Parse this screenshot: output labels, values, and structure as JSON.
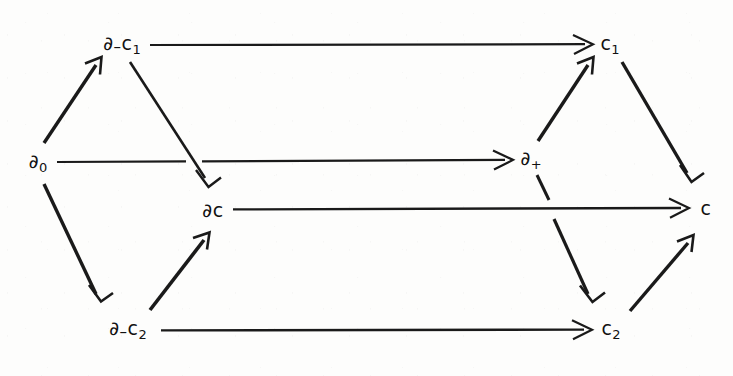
{
  "diagram": {
    "kind": "commutative-diagram",
    "background_color": "#fdfdfc",
    "ink_color": "#1a1a1a",
    "width": 733,
    "height": 376,
    "nodes": [
      {
        "id": "d0",
        "label_html": "∂<span class=\"sub\">0</span>",
        "label_text": "ℂ0",
        "x": 38,
        "y": 163
      },
      {
        "id": "dmc1",
        "label_html": "∂<span class=\"mid\">–</span>c<span class=\"sub\">1</span>",
        "label_text": "∂–c1",
        "x": 122,
        "y": 45
      },
      {
        "id": "dc",
        "label_html": "∂c",
        "label_text": "∂c",
        "x": 213,
        "y": 210
      },
      {
        "id": "dmc2",
        "label_html": "∂<span class=\"mid\">–</span>c<span class=\"sub\">2</span>",
        "label_text": "∂–c2",
        "x": 128,
        "y": 330
      },
      {
        "id": "dplus",
        "label_html": "∂<span class=\"sub\">+</span>",
        "label_text": "∂+",
        "x": 531,
        "y": 160
      },
      {
        "id": "c1",
        "label_html": "c<span class=\"sub\">1</span>",
        "label_text": "c1",
        "x": 610,
        "y": 45
      },
      {
        "id": "c",
        "label_html": "c",
        "label_text": "c",
        "x": 706,
        "y": 208
      },
      {
        "id": "c2",
        "label_html": "c<span class=\"sub\">2</span>",
        "label_text": "c2",
        "x": 611,
        "y": 330
      }
    ],
    "edges": [
      {
        "id": "e-d0-dmc1",
        "from": "d0",
        "to": "dmc1",
        "style": "thick"
      },
      {
        "id": "e-d0-dplus",
        "from": "d0",
        "to": "dplus",
        "style": "thin"
      },
      {
        "id": "e-d0-dmc2",
        "from": "d0",
        "to": "dmc2",
        "style": "thick"
      },
      {
        "id": "e-dmc1-c1",
        "from": "dmc1",
        "to": "c1",
        "style": "thin"
      },
      {
        "id": "e-dmc1-dc",
        "from": "dmc1",
        "to": "dc",
        "style": "thin"
      },
      {
        "id": "e-dmc2-dc",
        "from": "dmc2",
        "to": "dc",
        "style": "thick"
      },
      {
        "id": "e-dmc2-c2",
        "from": "dmc2",
        "to": "c2",
        "style": "thin"
      },
      {
        "id": "e-dc-c",
        "from": "dc",
        "to": "c",
        "style": "thin"
      },
      {
        "id": "e-dplus-c1",
        "from": "dplus",
        "to": "c1",
        "style": "thick"
      },
      {
        "id": "e-dplus-c2",
        "from": "dplus",
        "to": "c2",
        "style": "thick"
      },
      {
        "id": "e-c1-c",
        "from": "c1",
        "to": "c",
        "style": "thick"
      },
      {
        "id": "e-c2-c",
        "from": "c2",
        "to": "c",
        "style": "thick"
      }
    ]
  }
}
